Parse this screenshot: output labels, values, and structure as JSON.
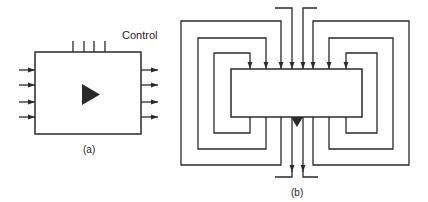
{
  "diagram_a": {
    "caption": "(a)",
    "control_label": "Control",
    "block": {
      "x": 35,
      "y": 52,
      "w": 106,
      "h": 82
    },
    "inputs": {
      "count": 4,
      "ys": [
        70,
        85,
        102,
        117
      ],
      "x_start": 19
    },
    "outputs": {
      "count": 4,
      "ys": [
        70,
        85,
        102,
        117
      ],
      "x_end": 158
    },
    "control_lines": {
      "count": 4,
      "xs": [
        73,
        84,
        94,
        105
      ],
      "y_top": 41
    },
    "symbol": "right-pointing-triangle"
  },
  "diagram_b": {
    "caption": "(b)",
    "block": {
      "x": 231,
      "y": 69,
      "w": 131,
      "h": 48
    },
    "feedback_loops": {
      "left": [
        {
          "name": "inner",
          "outer_x": 214,
          "top_y": 53,
          "bottom_y": 133,
          "port_x": 250
        },
        {
          "name": "middle",
          "outer_x": 198,
          "top_y": 38,
          "bottom_y": 149,
          "port_x": 266
        },
        {
          "name": "outer",
          "outer_x": 181,
          "top_y": 21,
          "bottom_y": 165,
          "port_x": 281
        }
      ],
      "right": [
        {
          "name": "inner",
          "outer_x": 377,
          "top_y": 53,
          "bottom_y": 133,
          "port_x": 346
        },
        {
          "name": "middle",
          "outer_x": 393,
          "top_y": 38,
          "bottom_y": 149,
          "port_x": 329
        },
        {
          "name": "outer",
          "outer_x": 409,
          "top_y": 21,
          "bottom_y": 165,
          "port_x": 313
        }
      ]
    },
    "external_inputs": [
      {
        "x": 292,
        "from_x": 275,
        "y": 8
      },
      {
        "x": 303,
        "from_x": 317,
        "y": 8
      }
    ],
    "external_outputs": [
      {
        "x": 292,
        "to_x": 275,
        "y": 177
      },
      {
        "x": 303,
        "to_x": 318,
        "y": 177
      }
    ],
    "symbol": "down-pointing-triangle"
  },
  "colors": {
    "stroke": "#2a2a2a",
    "background": "#ffffff"
  }
}
